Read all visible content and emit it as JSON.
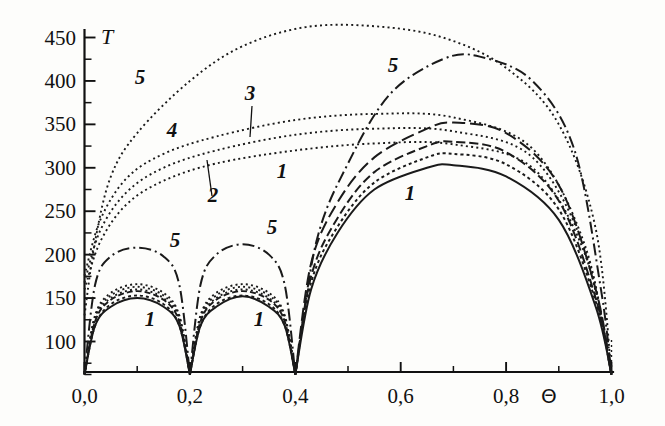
{
  "figure": {
    "background_color": "#fdfdfb",
    "ink_color": "#1a1a1a"
  },
  "chart_data": {
    "type": "line",
    "title": "",
    "subtitle": "",
    "xlabel": "Θ",
    "ylabel": "T",
    "xlim": [
      0.0,
      1.0
    ],
    "ylim": [
      60,
      470
    ],
    "grid": false,
    "legend": "inline-curve-labels",
    "x_ticks_major": [
      "0,0",
      "0,2",
      "0,4",
      "0,6",
      "0,8",
      "1,0"
    ],
    "x_tick_values": [
      0.0,
      0.2,
      0.4,
      0.6,
      0.8,
      1.0
    ],
    "x_ticks_minor": [
      0.1,
      0.3,
      0.5,
      0.7,
      0.9
    ],
    "y_ticks_major": [
      "100",
      "150",
      "200",
      "250",
      "300",
      "350",
      "400",
      "450"
    ],
    "y_tick_values": [
      100,
      150,
      200,
      250,
      300,
      350,
      400,
      450
    ],
    "y_ticks_minor": [
      75,
      125,
      175,
      225,
      275,
      325,
      375,
      425
    ],
    "series": [
      {
        "name": "1",
        "style": "solid",
        "lobes": [
          {
            "x": [
              0.0,
              0.02,
              0.05,
              0.1,
              0.15,
              0.18,
              0.2
            ],
            "y": [
              62,
              118,
              140,
              150,
              140,
              118,
              62
            ]
          },
          {
            "x": [
              0.2,
              0.22,
              0.25,
              0.3,
              0.35,
              0.38,
              0.4
            ],
            "y": [
              62,
              118,
              140,
              152,
              140,
              118,
              62
            ]
          },
          {
            "x": [
              0.4,
              0.43,
              0.48,
              0.55,
              0.65,
              0.7,
              0.8,
              0.9,
              0.97,
              1.0
            ],
            "y": [
              62,
              160,
              225,
              275,
              300,
              303,
              290,
              240,
              140,
              62
            ]
          }
        ]
      },
      {
        "name": "2",
        "style": "dotted",
        "lobes": [
          {
            "x": [
              0.0,
              0.02,
              0.05,
              0.1,
              0.15,
              0.18,
              0.2
            ],
            "y": [
              62,
              125,
              150,
              160,
              150,
              125,
              62
            ]
          },
          {
            "x": [
              0.2,
              0.22,
              0.25,
              0.3,
              0.35,
              0.38,
              0.4
            ],
            "y": [
              62,
              125,
              150,
              160,
              150,
              125,
              62
            ]
          },
          {
            "x": [
              0.0,
              0.03,
              0.08,
              0.15,
              0.25,
              0.4,
              0.55,
              0.7,
              0.85,
              0.95,
              1.0
            ],
            "y": [
              160,
              215,
              258,
              285,
              305,
              320,
              328,
              327,
              300,
              200,
              62
            ]
          }
        ]
      },
      {
        "name": "3",
        "style": "dotted",
        "lobes": [
          {
            "x": [
              0.0,
              0.02,
              0.05,
              0.1,
              0.15,
              0.18,
              0.2
            ],
            "y": [
              62,
              128,
              153,
              163,
              153,
              128,
              62
            ]
          },
          {
            "x": [
              0.2,
              0.22,
              0.25,
              0.3,
              0.35,
              0.38,
              0.4
            ],
            "y": [
              62,
              128,
              153,
              163,
              153,
              128,
              62
            ]
          },
          {
            "x": [
              0.0,
              0.03,
              0.08,
              0.15,
              0.25,
              0.4,
              0.55,
              0.7,
              0.85,
              0.95,
              1.0
            ],
            "y": [
              168,
              228,
              272,
              300,
              320,
              338,
              345,
              342,
              312,
              205,
              62
            ]
          }
        ]
      },
      {
        "name": "4",
        "style": "dotted",
        "lobes": [
          {
            "x": [
              0.0,
              0.02,
              0.05,
              0.1,
              0.15,
              0.18,
              0.2
            ],
            "y": [
              62,
              130,
              156,
              166,
              156,
              130,
              62
            ]
          },
          {
            "x": [
              0.2,
              0.22,
              0.25,
              0.3,
              0.35,
              0.38,
              0.4
            ],
            "y": [
              62,
              130,
              156,
              166,
              156,
              130,
              62
            ]
          },
          {
            "x": [
              0.0,
              0.03,
              0.08,
              0.15,
              0.25,
              0.4,
              0.55,
              0.7,
              0.85,
              0.95,
              1.0
            ],
            "y": [
              176,
              240,
              288,
              316,
              336,
              355,
              362,
              358,
              322,
              210,
              62
            ]
          }
        ]
      },
      {
        "name": "5",
        "style": "dash-dot",
        "lobes": [
          {
            "x": [
              0.0,
              0.02,
              0.05,
              0.1,
              0.15,
              0.18,
              0.2
            ],
            "y": [
              62,
              165,
              198,
              208,
              198,
              165,
              62
            ]
          },
          {
            "x": [
              0.2,
              0.22,
              0.25,
              0.3,
              0.35,
              0.38,
              0.4
            ],
            "y": [
              62,
              165,
              200,
              212,
              200,
              165,
              62
            ]
          },
          {
            "x": [
              0.4,
              0.44,
              0.5,
              0.58,
              0.68,
              0.75,
              0.85,
              0.93,
              0.98,
              1.0
            ],
            "y": [
              62,
              215,
              305,
              385,
              425,
              428,
              400,
              320,
              160,
              62
            ]
          }
        ]
      },
      {
        "name": "5-top-dotted",
        "style": "dotted",
        "lobes": [
          {
            "x": [
              0.0,
              0.02,
              0.05,
              0.1,
              0.2,
              0.3,
              0.42,
              0.55,
              0.68,
              0.8,
              0.9,
              0.97,
              1.0
            ],
            "y": [
              130,
              215,
              290,
              340,
              400,
              440,
              462,
              463,
              450,
              415,
              350,
              230,
              62
            ]
          }
        ]
      }
    ],
    "curve_labels": [
      {
        "text": "5",
        "x": 140,
        "y": 84,
        "leader": null
      },
      {
        "text": "4",
        "x": 172,
        "y": 137,
        "leader": null
      },
      {
        "text": "3",
        "x": 250,
        "y": 100,
        "leader": {
          "x1": 252,
          "y1": 106,
          "x2": 250,
          "y2": 137
        }
      },
      {
        "text": "2",
        "x": 213,
        "y": 202,
        "leader": {
          "x1": 212,
          "y1": 196,
          "x2": 207,
          "y2": 160
        }
      },
      {
        "text": "1",
        "x": 282,
        "y": 178,
        "leader": null
      },
      {
        "text": "5",
        "x": 175,
        "y": 247,
        "leader": null
      },
      {
        "text": "5",
        "x": 272,
        "y": 234,
        "leader": null
      },
      {
        "text": "5",
        "x": 393,
        "y": 72,
        "leader": null
      },
      {
        "text": "1",
        "x": 150,
        "y": 326,
        "leader": null
      },
      {
        "text": "1",
        "x": 259,
        "y": 326,
        "leader": null
      },
      {
        "text": "1",
        "x": 410,
        "y": 200,
        "leader": null
      }
    ]
  },
  "axes": {
    "y_axis_name": "T",
    "x_axis_name": "Θ"
  }
}
